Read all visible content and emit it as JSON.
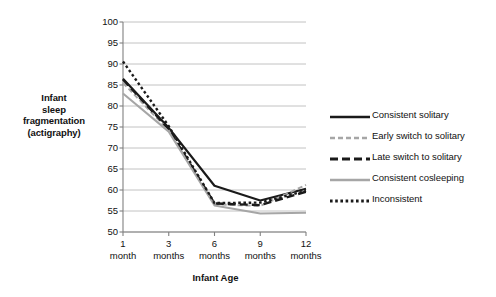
{
  "chart_data": {
    "type": "line",
    "title": "",
    "xlabel": "Infant Age",
    "ylabel": "Infant sleep fragmentation (actigraphy)",
    "ylabel_lines": [
      "Infant",
      "sleep",
      "fragmentation",
      "(actigraphy)"
    ],
    "categories": [
      "1 month",
      "3 months",
      "6 months",
      "9 months",
      "12 months"
    ],
    "x_tick_numbers": [
      "1",
      "3",
      "6",
      "9",
      "12"
    ],
    "x_tick_units": [
      "month",
      "months",
      "months",
      "months",
      "months"
    ],
    "x": [
      1,
      3,
      6,
      9,
      12
    ],
    "ylim": [
      50,
      100
    ],
    "yticks": [
      100,
      95,
      90,
      85,
      80,
      75,
      70,
      65,
      60,
      55,
      50
    ],
    "grid": "horizontal",
    "legend_position": "right",
    "series": [
      {
        "name": "Consistent solitary",
        "style": "solid",
        "color": "#1a1a1a",
        "width": 2.2,
        "values": [
          86.5,
          74.8,
          61.0,
          57.5,
          60.3
        ]
      },
      {
        "name": "Early switch to solitary",
        "style": "dashed",
        "color": "#a6a6a6",
        "width": 2.0,
        "values": [
          85.5,
          74.2,
          56.6,
          56.2,
          61.2
        ]
      },
      {
        "name": "Late switch to solitary",
        "style": "long-dash",
        "color": "#1a1a1a",
        "width": 2.4,
        "values": [
          86.3,
          74.5,
          56.8,
          56.4,
          59.6
        ]
      },
      {
        "name": "Consistent cosleeping",
        "style": "solid",
        "color": "#a6a6a6",
        "width": 2.0,
        "values": [
          83.0,
          73.9,
          56.3,
          54.4,
          54.6
        ]
      },
      {
        "name": "Inconsistent",
        "style": "dotted",
        "color": "#1a1a1a",
        "width": 2.4,
        "values": [
          90.6,
          75.2,
          56.9,
          57.0,
          59.8
        ]
      }
    ]
  },
  "legend": {
    "items": [
      {
        "label": "Consistent solitary"
      },
      {
        "label": "Early switch to solitary"
      },
      {
        "label": "Late switch to solitary"
      },
      {
        "label": "Consistent cosleeping"
      },
      {
        "label": "Inconsistent"
      }
    ]
  },
  "colors": {
    "black": "#1a1a1a",
    "gray": "#a6a6a6",
    "gridline": "#b3b3b3",
    "axis": "#808080",
    "background": "#ffffff"
  }
}
